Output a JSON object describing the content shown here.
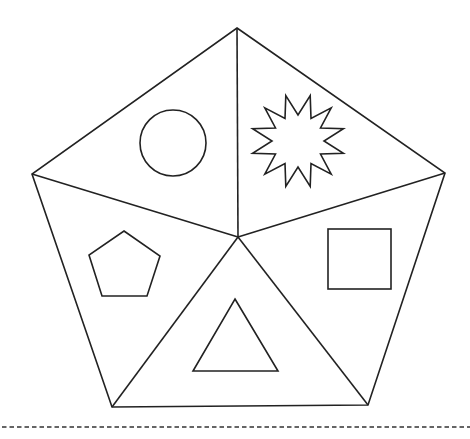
{
  "diagram": {
    "type": "pentagon-divided-into-five-triangles",
    "stroke_color": "#222222",
    "background_color": "#ffffff",
    "outer_pentagon": {
      "vertices": [
        [
          237,
          28
        ],
        [
          445,
          173
        ],
        [
          368,
          405
        ],
        [
          112,
          407
        ],
        [
          32,
          174
        ]
      ]
    },
    "center": [
      238,
      237
    ],
    "sections": [
      {
        "position": "top-left",
        "shape": "circle",
        "label": "circle",
        "cx": 173,
        "cy": 143,
        "r": 33
      },
      {
        "position": "top-right",
        "shape": "star",
        "label": "12-point star",
        "cx": 298,
        "cy": 141,
        "points": 12,
        "outer_r": 47,
        "inner_r": 26
      },
      {
        "position": "right",
        "shape": "square",
        "label": "square",
        "x": 328,
        "y": 229,
        "w": 63,
        "h": 60
      },
      {
        "position": "bottom",
        "shape": "triangle",
        "label": "triangle",
        "vertices": [
          [
            235,
            299
          ],
          [
            278,
            371
          ],
          [
            193,
            371
          ]
        ]
      },
      {
        "position": "left",
        "shape": "pentagon",
        "label": "pentagon",
        "vertices": [
          [
            124,
            231
          ],
          [
            160,
            256
          ],
          [
            147,
            296
          ],
          [
            102,
            296
          ],
          [
            89,
            255
          ]
        ]
      }
    ],
    "cut_line": {
      "style": "dashed",
      "y": 427,
      "x1": 2,
      "x2": 470
    }
  }
}
